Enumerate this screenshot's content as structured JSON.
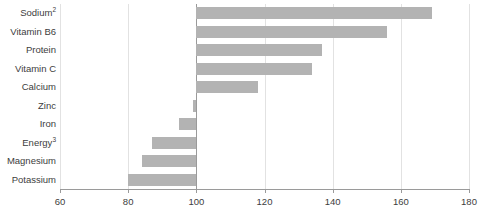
{
  "chart_data": {
    "type": "bar",
    "orientation": "horizontal",
    "title": "",
    "xlabel": "",
    "ylabel": "",
    "categories": [
      "Sodium",
      "Vitamin B6",
      "Protein",
      "Vitamin C",
      "Calcium",
      "Zinc",
      "Iron",
      "Energy",
      "Magnesium",
      "Potassium"
    ],
    "category_superscripts": [
      "2",
      "",
      "",
      "",
      "",
      "",
      "",
      "3",
      "",
      ""
    ],
    "values": [
      169,
      156,
      137,
      134,
      118,
      99,
      95,
      87,
      84,
      80
    ],
    "baseline": 100,
    "xlim": [
      60,
      180
    ],
    "xticks": [
      60,
      80,
      100,
      120,
      140,
      160,
      180
    ],
    "xtick_labels": [
      "60",
      "80",
      "100",
      "120",
      "140",
      "160",
      "180"
    ],
    "grid": true,
    "legend": false,
    "bar_color": "#b3b3b3",
    "gridline_color": "#e2e2e2",
    "axis_color": "#9a9a9a",
    "background_color": "#ffffff"
  }
}
